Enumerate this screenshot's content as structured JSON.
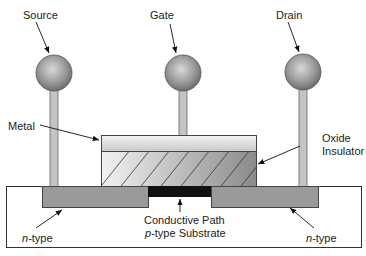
{
  "diagram": {
    "type": "MOSFET cross-section",
    "terminals": [
      {
        "id": "source",
        "label": "Source"
      },
      {
        "id": "gate",
        "label": "Gate"
      },
      {
        "id": "drain",
        "label": "Drain"
      }
    ],
    "labels": {
      "metal": "Metal",
      "oxide_line1": "Oxide",
      "oxide_line2": "Insulator",
      "conductive_path": "Conductive Path",
      "substrate_italic": "p",
      "substrate_rest": "-type Substrate",
      "ntype_left_italic": "n",
      "ntype_left_rest": "-type",
      "ntype_right_italic": "n",
      "ntype_right_rest": "-type"
    },
    "colors": {
      "terminal_ball": "#8a8a8a",
      "stick": "#c4c4c4",
      "metal": "#e0e0e0",
      "n_region": "#9a9a9a",
      "conductive_path": "#111111",
      "substrate": "#ffffff",
      "outline": "#333333"
    }
  }
}
